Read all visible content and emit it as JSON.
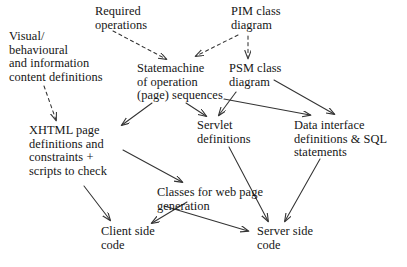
{
  "diagram": {
    "background_color": "#ffffff",
    "text_color": "#161616",
    "arrow_color": "#333333",
    "nodes": [
      {
        "id": "visual-behavioural-content",
        "name": "visual-behavioural-content-definitions",
        "lines": [
          "Visual/",
          "behavioural",
          "and information",
          "content definitions"
        ],
        "x": 9,
        "y": 30
      },
      {
        "id": "required-operations",
        "name": "required-operations",
        "lines": [
          "Required",
          "operations"
        ],
        "x": 95,
        "y": 5
      },
      {
        "id": "pim-class-diagram",
        "name": "pim-class-diagram",
        "lines": [
          "PIM class",
          "diagram"
        ],
        "x": 231,
        "y": 5
      },
      {
        "id": "statemachine-operation",
        "name": "statemachine-of-operation-page-sequences",
        "lines": [
          "Statemachine",
          "of operation",
          "(page) sequences"
        ],
        "x": 137,
        "y": 62
      },
      {
        "id": "psm-class-diagram",
        "name": "psm-class-diagram",
        "lines": [
          "PSM class",
          "diagram"
        ],
        "x": 229,
        "y": 62
      },
      {
        "id": "xhtml-page-definitions",
        "name": "xhtml-page-definitions-and-constraints",
        "lines": [
          "XHTML page",
          "definitions and",
          "constraints +",
          "scripts to check"
        ],
        "x": 29,
        "y": 124
      },
      {
        "id": "servlet-definitions",
        "name": "servlet-definitions",
        "lines": [
          "Servlet",
          "definitions"
        ],
        "x": 197,
        "y": 119
      },
      {
        "id": "data-interface-definitions",
        "name": "data-interface-definitions-and-sql-statements",
        "lines": [
          "Data interface",
          "definitions & SQL",
          "statements"
        ],
        "x": 294,
        "y": 119
      },
      {
        "id": "classes-web-page-generation",
        "name": "classes-for-web-page-generation",
        "lines": [
          "Classes for web page",
          "generation"
        ],
        "x": 157,
        "y": 186
      },
      {
        "id": "client-side-code",
        "name": "client-side-code",
        "lines": [
          "Client side",
          "code"
        ],
        "x": 101,
        "y": 225
      },
      {
        "id": "server-side-code",
        "name": "server-side-code",
        "lines": [
          "Server side",
          "code"
        ],
        "x": 257,
        "y": 225
      }
    ],
    "edges": [
      {
        "id": "edge-required-ops-to-statemachine",
        "name": "arrow-required-operations-to-statemachine",
        "from": "required-operations",
        "to": "statemachine-operation",
        "style": "dashed",
        "x1": 113,
        "y1": 31,
        "x2": 166,
        "y2": 59
      },
      {
        "id": "edge-pim-to-statemachine",
        "name": "arrow-pim-class-diagram-to-statemachine",
        "from": "pim-class-diagram",
        "to": "statemachine-operation",
        "style": "dashed",
        "x1": 238,
        "y1": 35,
        "x2": 196,
        "y2": 56
      },
      {
        "id": "edge-pim-to-psm",
        "name": "arrow-pim-class-diagram-to-psm-class-diagram",
        "from": "pim-class-diagram",
        "to": "psm-class-diagram",
        "style": "dashed",
        "x1": 248,
        "y1": 36,
        "x2": 248,
        "y2": 58
      },
      {
        "id": "edge-visual-to-xhtml",
        "name": "arrow-visual-definitions-to-xhtml-page-definitions",
        "from": "visual-behavioural-content",
        "to": "xhtml-page-definitions",
        "style": "dashed",
        "x1": 44,
        "y1": 86,
        "x2": 56,
        "y2": 120
      },
      {
        "id": "edge-statemachine-to-xhtml",
        "name": "arrow-statemachine-to-xhtml-page-definitions",
        "from": "statemachine-operation",
        "to": "xhtml-page-definitions",
        "style": "solid",
        "x1": 152,
        "y1": 103,
        "x2": 122,
        "y2": 125
      },
      {
        "id": "edge-statemachine-to-servlet",
        "name": "arrow-statemachine-to-servlet-definitions",
        "from": "statemachine-operation",
        "to": "servlet-definitions",
        "style": "solid",
        "x1": 186,
        "y1": 103,
        "x2": 206,
        "y2": 116
      },
      {
        "id": "edge-statemachine-to-data-interface",
        "name": "arrow-statemachine-to-data-interface-definitions",
        "from": "statemachine-operation",
        "to": "data-interface-definitions",
        "style": "solid",
        "x1": 224,
        "y1": 99,
        "x2": 310,
        "y2": 115
      },
      {
        "id": "edge-psm-to-servlet",
        "name": "arrow-psm-class-diagram-to-servlet-definitions",
        "from": "psm-class-diagram",
        "to": "servlet-definitions",
        "style": "solid",
        "x1": 236,
        "y1": 92,
        "x2": 219,
        "y2": 115
      },
      {
        "id": "edge-psm-to-data-interface",
        "name": "arrow-psm-class-diagram-to-data-interface-definitions",
        "from": "psm-class-diagram",
        "to": "data-interface-definitions",
        "style": "solid",
        "x1": 274,
        "y1": 80,
        "x2": 334,
        "y2": 114
      },
      {
        "id": "edge-xhtml-to-classes",
        "name": "arrow-xhtml-page-definitions-to-classes-for-web-page-generation",
        "from": "xhtml-page-definitions",
        "to": "classes-web-page-generation",
        "style": "solid",
        "x1": 123,
        "y1": 150,
        "x2": 182,
        "y2": 182
      },
      {
        "id": "edge-xhtml-to-client",
        "name": "arrow-xhtml-page-definitions-to-client-side-code",
        "from": "xhtml-page-definitions",
        "to": "client-side-code",
        "style": "solid",
        "x1": 84,
        "y1": 186,
        "x2": 110,
        "y2": 220
      },
      {
        "id": "edge-classes-to-client",
        "name": "arrow-classes-for-web-page-generation-to-client-side-code",
        "from": "classes-web-page-generation",
        "to": "client-side-code",
        "style": "solid",
        "x1": 187,
        "y1": 202,
        "x2": 152,
        "y2": 223
      },
      {
        "id": "edge-classes-to-server",
        "name": "arrow-classes-for-web-page-generation-to-server-side-code",
        "from": "classes-web-page-generation",
        "to": "server-side-code",
        "style": "solid",
        "x1": 164,
        "y1": 206,
        "x2": 248,
        "y2": 231
      },
      {
        "id": "edge-servlet-to-server",
        "name": "arrow-servlet-definitions-to-server-side-code",
        "from": "servlet-definitions",
        "to": "server-side-code",
        "style": "solid",
        "x1": 229,
        "y1": 147,
        "x2": 268,
        "y2": 221
      },
      {
        "id": "edge-data-interface-to-server",
        "name": "arrow-data-interface-definitions-to-server-side-code",
        "from": "data-interface-definitions",
        "to": "server-side-code",
        "style": "solid",
        "x1": 320,
        "y1": 159,
        "x2": 285,
        "y2": 221
      }
    ]
  }
}
